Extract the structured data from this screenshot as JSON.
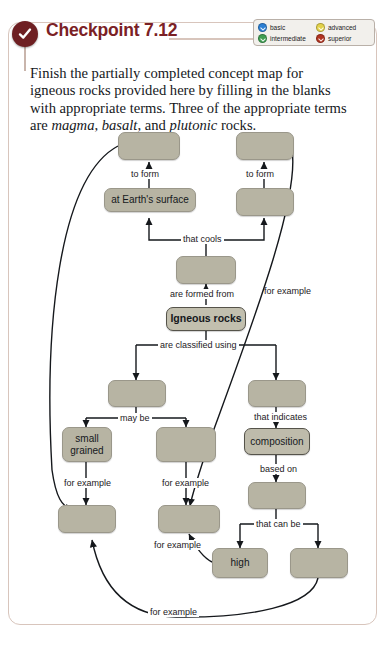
{
  "header": {
    "badge_icon": "check-circle-icon",
    "title": "Checkpoint 7.12"
  },
  "legend": {
    "items": [
      {
        "label": "basic",
        "color": "#2b7fd4"
      },
      {
        "label": "advanced",
        "color": "#e3d24a"
      },
      {
        "label": "intermediate",
        "color": "#3f9e52"
      },
      {
        "label": "superior",
        "color": "#b2331f"
      }
    ]
  },
  "prompt": {
    "part1": "Finish the partially completed concept map for igneous rocks provided here by filling in the blanks with appropriate terms. Three of the appropriate terms are ",
    "term1": "magma",
    "sep1": ", ",
    "term2": "basalt",
    "sep2": ", and ",
    "term3": "plutonic",
    "part2": " rocks."
  },
  "concept_map": {
    "nodes": [
      {
        "id": "n-top-left",
        "label": "",
        "blank": true,
        "key": false
      },
      {
        "id": "n-top-right",
        "label": "",
        "blank": true,
        "key": false
      },
      {
        "id": "n-earth-surface",
        "label": "at Earth's surface",
        "blank": false,
        "key": false
      },
      {
        "id": "n-mid-right-upper",
        "label": "",
        "blank": true,
        "key": false
      },
      {
        "id": "n-magma-blank",
        "label": "",
        "blank": true,
        "key": false
      },
      {
        "id": "n-igneous-rocks",
        "label": "Igneous rocks",
        "blank": false,
        "key": true
      },
      {
        "id": "n-texture-blank",
        "label": "",
        "blank": true,
        "key": false
      },
      {
        "id": "n-indicator-blank",
        "label": "",
        "blank": true,
        "key": false
      },
      {
        "id": "n-small-grained",
        "label": "small grained",
        "blank": false,
        "key": false
      },
      {
        "id": "n-coarse-blank",
        "label": "",
        "blank": true,
        "key": false
      },
      {
        "id": "n-composition",
        "label": "composition",
        "blank": false,
        "key": true
      },
      {
        "id": "n-silica-blank",
        "label": "",
        "blank": true,
        "key": false
      },
      {
        "id": "n-basalt-blank",
        "label": "",
        "blank": true,
        "key": false
      },
      {
        "id": "n-granite-blank",
        "label": "",
        "blank": true,
        "key": false
      },
      {
        "id": "n-high",
        "label": "high",
        "blank": false,
        "key": false
      },
      {
        "id": "n-low-blank",
        "label": "",
        "blank": true,
        "key": false
      }
    ],
    "edge_labels": [
      {
        "id": "e-to-form-left",
        "text": "to form"
      },
      {
        "id": "e-to-form-right",
        "text": "to form"
      },
      {
        "id": "e-that-cools",
        "text": "that cools"
      },
      {
        "id": "e-are-formed-from",
        "text": "are formed from"
      },
      {
        "id": "e-for-example-right",
        "text": "for example"
      },
      {
        "id": "e-are-classified",
        "text": "are classified using"
      },
      {
        "id": "e-may-be",
        "text": "may be"
      },
      {
        "id": "e-that-indicates",
        "text": "that indicates"
      },
      {
        "id": "e-for-example-1",
        "text": "for example"
      },
      {
        "id": "e-for-example-2",
        "text": "for example"
      },
      {
        "id": "e-based-on",
        "text": "based on"
      },
      {
        "id": "e-that-can-be",
        "text": "that can be"
      },
      {
        "id": "e-for-example-3",
        "text": "for example"
      },
      {
        "id": "e-for-example-4",
        "text": "for example"
      }
    ]
  }
}
